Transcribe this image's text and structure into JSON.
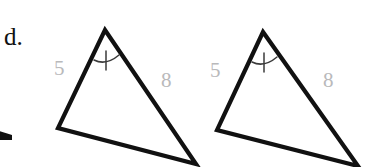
{
  "page": {
    "problem_letter": "d.",
    "background_color": "#ffffff",
    "stroke_color": "#111111",
    "label_color": "#b9b9bb",
    "width": 378,
    "height": 167
  },
  "figures": [
    {
      "name": "triangle-left",
      "vertices": {
        "apex": [
          105,
          30
        ],
        "bottom_left": [
          58,
          128
        ],
        "bottom_right": [
          196,
          164
        ]
      },
      "labels": {
        "left_side": "5",
        "right_side": "8"
      },
      "angle_mark": {
        "location": "apex",
        "type": "single-tick-arc",
        "ticks": 1
      }
    },
    {
      "name": "triangle-right",
      "vertices": {
        "apex": [
          263,
          32
        ],
        "bottom_left": [
          217,
          130
        ],
        "bottom_right": [
          358,
          166
        ]
      },
      "labels": {
        "left_side": "5",
        "right_side": "8"
      },
      "angle_mark": {
        "location": "apex",
        "type": "single-tick-arc",
        "ticks": 1
      }
    }
  ],
  "edge_artifact": {
    "name": "partial-stroke-left-edge",
    "description": "clipped stroke fragment at left border"
  }
}
